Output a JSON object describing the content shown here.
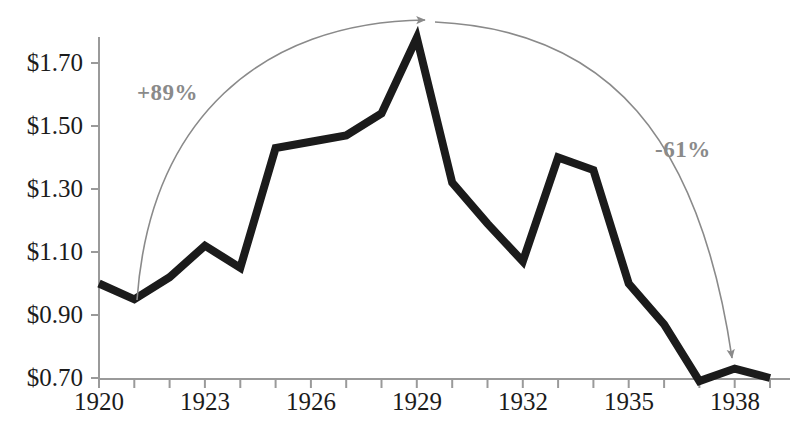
{
  "chart_data": {
    "type": "line",
    "title": "",
    "subtitle": "",
    "xlabel": "",
    "ylabel": "",
    "grid": false,
    "legend": "none",
    "x": [
      1920,
      1921,
      1922,
      1923,
      1924,
      1925,
      1926,
      1927,
      1928,
      1929,
      1930,
      1931,
      1932,
      1933,
      1934,
      1935,
      1936,
      1937,
      1938,
      1939
    ],
    "values": [
      1.0,
      0.95,
      1.02,
      1.12,
      1.05,
      1.43,
      1.45,
      1.47,
      1.54,
      1.78,
      1.32,
      1.19,
      1.07,
      1.4,
      1.36,
      1.0,
      0.87,
      0.69,
      0.73,
      0.7
    ],
    "series": [
      {
        "name": "price",
        "values": [
          1.0,
          0.95,
          1.02,
          1.12,
          1.05,
          1.43,
          1.45,
          1.47,
          1.54,
          1.78,
          1.32,
          1.19,
          1.07,
          1.4,
          1.36,
          1.0,
          0.87,
          0.69,
          0.73,
          0.7
        ]
      }
    ],
    "xlim": [
      1920,
      1939
    ],
    "ylim": [
      0.7,
      1.8
    ],
    "yticks": [
      0.7,
      0.9,
      1.1,
      1.3,
      1.5,
      1.7
    ],
    "ytick_labels": [
      "$0.70",
      "$0.90",
      "$1.10",
      "$1.30",
      "$1.50",
      "$1.70"
    ],
    "xticks": [
      1920,
      1921,
      1922,
      1923,
      1924,
      1925,
      1926,
      1927,
      1928,
      1929,
      1930,
      1931,
      1932,
      1933,
      1934,
      1935,
      1936,
      1937,
      1938,
      1939
    ],
    "xtick_labels_shown": [
      "1920",
      "1923",
      "1926",
      "1929",
      "1932",
      "1935",
      "1938"
    ],
    "xtick_labels_shown_values": [
      1920,
      1923,
      1926,
      1929,
      1932,
      1935,
      1938
    ],
    "annotations": [
      {
        "id": "rise-annotation",
        "text": "+89%",
        "from_year": 1921,
        "to_year": 1929,
        "color": "#8a8a8a",
        "arrow": "curved-right"
      },
      {
        "id": "fall-annotation",
        "text": "-61%",
        "from_year": 1929,
        "to_year": 1937,
        "color": "#8a8a8a",
        "arrow": "curved-down"
      }
    ],
    "colors": {
      "line": "#1b1b1b",
      "axis": "#9a9a9a",
      "tick_label": "#1b1b1b",
      "annotation": "#8a8a8a",
      "background": "#ffffff"
    }
  },
  "axes": {
    "y_labels": [
      {
        "text": "$1.70",
        "y": 63
      },
      {
        "text": "$1.50",
        "y": 126
      },
      {
        "text": "$1.30",
        "y": 189
      },
      {
        "text": "$1.10",
        "y": 252
      },
      {
        "text": "$0.90",
        "y": 315
      },
      {
        "text": "$0.70",
        "y": 378
      }
    ],
    "x_labels": [
      {
        "text": "1920",
        "x": 99
      },
      {
        "text": "1923",
        "x": 205
      },
      {
        "text": "1926",
        "x": 311
      },
      {
        "text": "1929",
        "x": 417
      },
      {
        "text": "1932",
        "x": 523
      },
      {
        "text": "1935",
        "x": 629
      },
      {
        "text": "1938",
        "x": 735
      }
    ]
  },
  "annotations_layout": [
    {
      "text": "+89%",
      "x": 137,
      "y": 80
    },
    {
      "text": "-61%",
      "x": 655,
      "y": 137
    }
  ]
}
